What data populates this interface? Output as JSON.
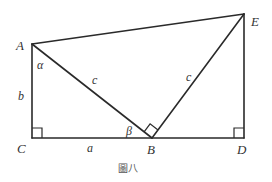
{
  "figure": {
    "caption": "圖八",
    "type": "geometric-diagram"
  },
  "vertices": {
    "A": {
      "label": "A",
      "x": 32,
      "y": 44
    },
    "B": {
      "label": "B",
      "x": 152,
      "y": 138
    },
    "C": {
      "label": "C",
      "x": 32,
      "y": 138
    },
    "D": {
      "label": "D",
      "x": 244,
      "y": 138
    },
    "E": {
      "label": "E",
      "x": 244,
      "y": 14
    }
  },
  "segments": [
    {
      "from": "A",
      "to": "C",
      "label": "b"
    },
    {
      "from": "C",
      "to": "B",
      "label": "a"
    },
    {
      "from": "B",
      "to": "D",
      "label": ""
    },
    {
      "from": "D",
      "to": "E",
      "label": ""
    },
    {
      "from": "E",
      "to": "A",
      "label": ""
    },
    {
      "from": "A",
      "to": "B",
      "label": "c"
    },
    {
      "from": "B",
      "to": "E",
      "label": "c"
    }
  ],
  "labels": {
    "side_b": "b",
    "side_a": "a",
    "side_AB": "c",
    "side_BE": "c",
    "angle_alpha": "α",
    "angle_beta": "β"
  },
  "right_angles": [
    "C",
    "B",
    "D"
  ],
  "colors": {
    "stroke": "#2a2a2a",
    "text": "#333333",
    "caption": "#555555",
    "background": "#ffffff"
  }
}
